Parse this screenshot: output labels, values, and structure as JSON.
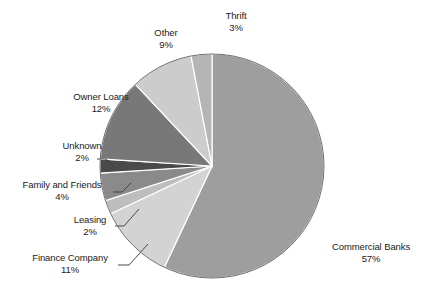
{
  "chart_data": {
    "type": "pie",
    "title": "",
    "subtitle": "",
    "xlabel": "",
    "ylabel": "",
    "legend_position": "none",
    "grid": false,
    "units": "percent",
    "start_angle_deg": 0,
    "direction": "clockwise",
    "categories": [
      "Commercial Banks",
      "Finance Company",
      "Leasing",
      "Family and Friends",
      "Unknown",
      "Owner Loans",
      "Other",
      "Thrift"
    ],
    "values": [
      57,
      11,
      2,
      4,
      2,
      12,
      9,
      3
    ],
    "slices": [
      {
        "label": "Commercial Banks",
        "value": 57,
        "value_text": "57%",
        "color": "#9e9e9e",
        "label_position": "right",
        "leader_line": false
      },
      {
        "label": "Finance Company",
        "value": 11,
        "value_text": "11%",
        "color": "#d3d3d3",
        "label_position": "bottom-left",
        "leader_line": true
      },
      {
        "label": "Leasing",
        "value": 2,
        "value_text": "2%",
        "color": "#bdbdbd",
        "label_position": "left",
        "leader_line": true
      },
      {
        "label": "Family and Friends",
        "value": 4,
        "value_text": "4%",
        "color": "#8a8a8a",
        "label_position": "left",
        "leader_line": true
      },
      {
        "label": "Unknown",
        "value": 2,
        "value_text": "2%",
        "color": "#4a4a4a",
        "label_position": "left",
        "leader_line": true
      },
      {
        "label": "Owner Loans",
        "value": 12,
        "value_text": "12%",
        "color": "#787878",
        "label_position": "upper-left",
        "leader_line": false
      },
      {
        "label": "Other",
        "value": 9,
        "value_text": "9%",
        "color": "#cccccc",
        "label_position": "top-left",
        "leader_line": false
      },
      {
        "label": "Thrift",
        "value": 3,
        "value_text": "3%",
        "color": "#b5b5b5",
        "label_position": "top",
        "leader_line": false
      }
    ]
  },
  "figure": {
    "background_color": "#ffffff",
    "slice_border_color": "#ffffff",
    "outline_color": "#6e6e6e",
    "text_color": "#222222",
    "center_x": 212,
    "center_y": 166,
    "radius": 112
  }
}
